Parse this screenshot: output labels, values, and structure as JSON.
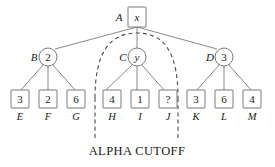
{
  "figure": {
    "caption": "ALPHA CUTOFF",
    "colors": {
      "stroke": "#6b6b6b",
      "text": "#1a1a1a",
      "cutoff": "#4a4a4a",
      "background": "#ffffff"
    }
  },
  "tree": {
    "root": {
      "label": "A",
      "value": "x",
      "shape": "square",
      "cx": 137,
      "cy": 17
    },
    "internal": [
      {
        "label": "B",
        "value": "2",
        "shape": "circle",
        "cx": 48,
        "cy": 57
      },
      {
        "label": "C",
        "value": "y",
        "shape": "circle",
        "cx": 137,
        "cy": 57
      },
      {
        "label": "D",
        "value": "3",
        "shape": "circle",
        "cx": 224,
        "cy": 57
      }
    ],
    "leaves": [
      {
        "label": "E",
        "value": "3",
        "parent": "B",
        "cx": 20
      },
      {
        "label": "F",
        "value": "2",
        "parent": "B",
        "cx": 48
      },
      {
        "label": "G",
        "value": "6",
        "parent": "B",
        "cx": 76
      },
      {
        "label": "H",
        "value": "4",
        "parent": "C",
        "cx": 104
      },
      {
        "label": "I",
        "value": "1",
        "parent": "C",
        "cx": 137
      },
      {
        "label": "J",
        "value": "?",
        "parent": "C",
        "cx": 166
      },
      {
        "label": "K",
        "value": "3",
        "parent": "D",
        "cx": 196
      },
      {
        "label": "L",
        "value": "6",
        "parent": "D",
        "cx": 224
      },
      {
        "label": "M",
        "value": "4",
        "parent": "D",
        "cx": 252
      }
    ],
    "leaf_row_y": 98,
    "leaf_label_y": 119
  },
  "cutoff": {
    "name": "alpha-cutoff-region",
    "left_x": 95,
    "right_x": 178,
    "bottom_y": 140
  }
}
